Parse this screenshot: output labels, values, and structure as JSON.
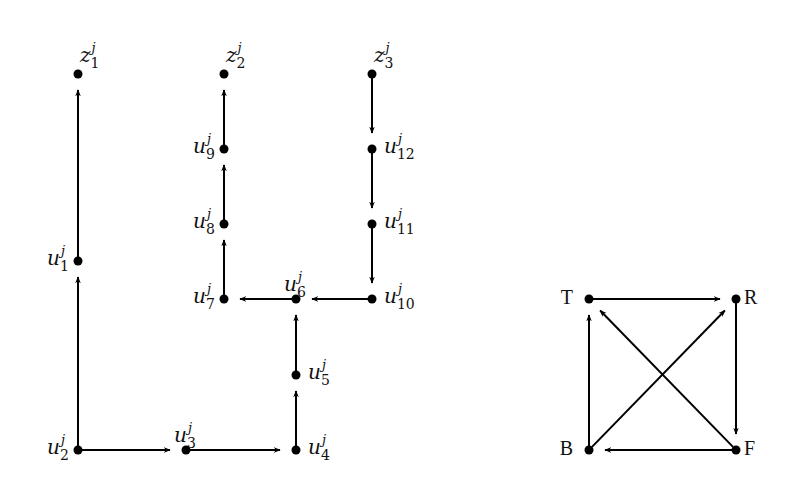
{
  "diagram": {
    "left_graph": {
      "name": "gadget",
      "nodes": [
        {
          "id": "z1",
          "base": "z",
          "sub": "1",
          "sup": "j",
          "x": 78,
          "y": 74,
          "label_pos": "above-right"
        },
        {
          "id": "z2",
          "base": "z",
          "sub": "2",
          "sup": "j",
          "x": 224,
          "y": 74,
          "label_pos": "above-right"
        },
        {
          "id": "z3",
          "base": "z",
          "sub": "3",
          "sup": "j",
          "x": 372,
          "y": 74,
          "label_pos": "above-right"
        },
        {
          "id": "u1",
          "base": "u",
          "sub": "1",
          "sup": "j",
          "x": 78,
          "y": 261,
          "label_pos": "left"
        },
        {
          "id": "u2",
          "base": "u",
          "sub": "2",
          "sup": "j",
          "x": 78,
          "y": 450,
          "label_pos": "left"
        },
        {
          "id": "u3",
          "base": "u",
          "sub": "3",
          "sup": "j",
          "x": 186,
          "y": 450,
          "label_pos": "above"
        },
        {
          "id": "u4",
          "base": "u",
          "sub": "4",
          "sup": "j",
          "x": 296,
          "y": 450,
          "label_pos": "right"
        },
        {
          "id": "u5",
          "base": "u",
          "sub": "5",
          "sup": "j",
          "x": 296,
          "y": 375,
          "label_pos": "right"
        },
        {
          "id": "u6",
          "base": "u",
          "sub": "6",
          "sup": "j",
          "x": 296,
          "y": 299,
          "label_pos": "above"
        },
        {
          "id": "u7",
          "base": "u",
          "sub": "7",
          "sup": "j",
          "x": 224,
          "y": 299,
          "label_pos": "left"
        },
        {
          "id": "u8",
          "base": "u",
          "sub": "8",
          "sup": "j",
          "x": 224,
          "y": 224,
          "label_pos": "left"
        },
        {
          "id": "u9",
          "base": "u",
          "sub": "9",
          "sup": "j",
          "x": 224,
          "y": 149,
          "label_pos": "left"
        },
        {
          "id": "u10",
          "base": "u",
          "sub": "10",
          "sup": "j",
          "x": 372,
          "y": 299,
          "label_pos": "right"
        },
        {
          "id": "u11",
          "base": "u",
          "sub": "11",
          "sup": "j",
          "x": 372,
          "y": 224,
          "label_pos": "right"
        },
        {
          "id": "u12",
          "base": "u",
          "sub": "12",
          "sup": "j",
          "x": 372,
          "y": 149,
          "label_pos": "right"
        }
      ],
      "edges": [
        {
          "from": "u2",
          "to": "u1"
        },
        {
          "from": "u1",
          "to": "z1"
        },
        {
          "from": "u2",
          "to": "u3"
        },
        {
          "from": "u3",
          "to": "u4"
        },
        {
          "from": "u4",
          "to": "u5"
        },
        {
          "from": "u5",
          "to": "u6"
        },
        {
          "from": "u6",
          "to": "u7"
        },
        {
          "from": "u10",
          "to": "u6"
        },
        {
          "from": "u7",
          "to": "u8"
        },
        {
          "from": "u8",
          "to": "u9"
        },
        {
          "from": "u9",
          "to": "z2"
        },
        {
          "from": "z3",
          "to": "u12"
        },
        {
          "from": "u12",
          "to": "u11"
        },
        {
          "from": "u11",
          "to": "u10"
        }
      ]
    },
    "right_graph": {
      "name": "square",
      "nodes": [
        {
          "id": "T",
          "label": "T",
          "x": 589,
          "y": 299,
          "label_pos": "left"
        },
        {
          "id": "R",
          "label": "R",
          "x": 736,
          "y": 299,
          "label_pos": "right"
        },
        {
          "id": "B",
          "label": "B",
          "x": 589,
          "y": 450,
          "label_pos": "left"
        },
        {
          "id": "F",
          "label": "F",
          "x": 736,
          "y": 450,
          "label_pos": "right"
        }
      ],
      "edges": [
        {
          "from": "T",
          "to": "R"
        },
        {
          "from": "R",
          "to": "F"
        },
        {
          "from": "F",
          "to": "B"
        },
        {
          "from": "B",
          "to": "T"
        },
        {
          "from": "B",
          "to": "R"
        },
        {
          "from": "F",
          "to": "T"
        }
      ]
    },
    "style": {
      "node_color": "#000000",
      "edge_color": "#000000",
      "background": "#ffffff"
    }
  }
}
